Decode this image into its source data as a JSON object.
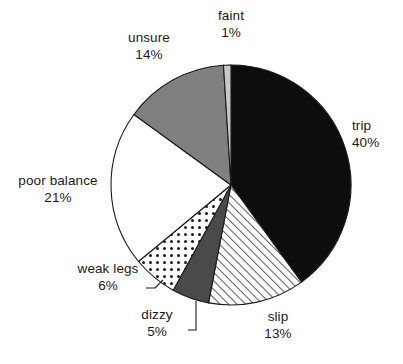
{
  "chart_data": {
    "type": "pie",
    "title": "",
    "subtitle": "",
    "xlabel": "",
    "ylabel": "",
    "legend_position": "none",
    "grid": false,
    "labels_outside": true,
    "start_angle_deg": 0,
    "direction": "clockwise",
    "categories": [
      "trip",
      "slip",
      "dizzy",
      "weak legs",
      "poor balance",
      "unsure",
      "faint"
    ],
    "values": [
      40,
      13,
      5,
      6,
      21,
      14,
      1
    ],
    "value_unit": "%",
    "slices": [
      {
        "label": "trip",
        "percent_text": "40%",
        "value": 40,
        "fill_style": "solid-black",
        "fill_color": "#0d0d0d",
        "label_position": "right"
      },
      {
        "label": "slip",
        "percent_text": "13%",
        "value": 13,
        "fill_style": "diagonal-hatch",
        "fill_color": "#ffffff",
        "pattern_color": "#1a1a1a",
        "label_position": "bottom"
      },
      {
        "label": "dizzy",
        "percent_text": "5%",
        "value": 5,
        "fill_style": "solid-dark-gray",
        "fill_color": "#4a4a4a",
        "label_position": "bottom-left",
        "leader_line": true
      },
      {
        "label": "weak legs",
        "percent_text": "6%",
        "value": 6,
        "fill_style": "dotted-grid",
        "fill_color": "#ffffff",
        "pattern_color": "#1a1a1a",
        "label_position": "left-bottom",
        "leader_line": true
      },
      {
        "label": "poor balance",
        "percent_text": "21%",
        "value": 21,
        "fill_style": "solid-white",
        "fill_color": "#ffffff",
        "label_position": "left"
      },
      {
        "label": "unsure",
        "percent_text": "14%",
        "value": 14,
        "fill_style": "solid-medium-gray",
        "fill_color": "#808080",
        "label_position": "top-left"
      },
      {
        "label": "faint",
        "percent_text": "1%",
        "value": 1,
        "fill_style": "solid-light-gray",
        "fill_color": "#c8c8c8",
        "label_position": "top"
      }
    ],
    "total": 100,
    "outline_color": "#1a1a1a"
  },
  "labels": {
    "faint": {
      "name": "faint",
      "pct": "1%"
    },
    "unsure": {
      "name": "unsure",
      "pct": "14%"
    },
    "trip": {
      "name": "trip",
      "pct": "40%"
    },
    "poor_balance": {
      "name": "poor balance",
      "pct": "21%"
    },
    "weak_legs": {
      "name": "weak legs",
      "pct": "6%"
    },
    "dizzy": {
      "name": "dizzy",
      "pct": "5%"
    },
    "slip": {
      "name": "slip",
      "pct": "13%"
    }
  }
}
